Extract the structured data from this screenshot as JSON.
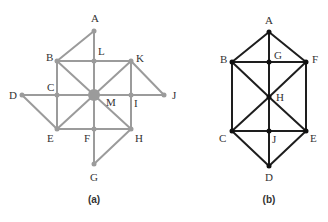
{
  "figures": [
    {
      "id": "a",
      "caption": "(a)",
      "caption_pos": [
        94,
        203
      ],
      "line_color": "#9b9b9b",
      "node_color": "#9b9b9b",
      "line_width": 2,
      "node_radius": 2.5,
      "nodes": [
        {
          "id": "A",
          "x": 94,
          "y": 31,
          "lx": 91,
          "ly": 22
        },
        {
          "id": "B",
          "x": 57,
          "y": 61,
          "lx": 46,
          "ly": 61
        },
        {
          "id": "L",
          "x": 94,
          "y": 61,
          "lx": 98,
          "ly": 55
        },
        {
          "id": "K",
          "x": 131,
          "y": 61,
          "lx": 136,
          "ly": 62
        },
        {
          "id": "D",
          "x": 22,
          "y": 95,
          "lx": 9,
          "ly": 99
        },
        {
          "id": "C",
          "x": 57,
          "y": 95,
          "lx": 47,
          "ly": 91
        },
        {
          "id": "M",
          "x": 94,
          "y": 95,
          "lx": 106,
          "ly": 106,
          "radius": 6
        },
        {
          "id": "I",
          "x": 131,
          "y": 95,
          "lx": 134,
          "ly": 107
        },
        {
          "id": "J",
          "x": 164,
          "y": 95,
          "lx": 172,
          "ly": 99
        },
        {
          "id": "E",
          "x": 57,
          "y": 129,
          "lx": 47,
          "ly": 142
        },
        {
          "id": "F",
          "x": 94,
          "y": 129,
          "lx": 84,
          "ly": 142
        },
        {
          "id": "H",
          "x": 131,
          "y": 129,
          "lx": 135,
          "ly": 142
        },
        {
          "id": "G",
          "x": 94,
          "y": 164,
          "lx": 90,
          "ly": 181
        }
      ],
      "edges": [
        [
          "A",
          "L"
        ],
        [
          "A",
          "B"
        ],
        [
          "B",
          "L"
        ],
        [
          "L",
          "K"
        ],
        [
          "L",
          "M"
        ],
        [
          "B",
          "C"
        ],
        [
          "B",
          "M"
        ],
        [
          "C",
          "D"
        ],
        [
          "C",
          "M"
        ],
        [
          "D",
          "E"
        ],
        [
          "C",
          "E"
        ],
        [
          "E",
          "M"
        ],
        [
          "E",
          "F"
        ],
        [
          "F",
          "M"
        ],
        [
          "F",
          "G"
        ],
        [
          "G",
          "H"
        ],
        [
          "F",
          "H"
        ],
        [
          "H",
          "M"
        ],
        [
          "H",
          "I"
        ],
        [
          "I",
          "M"
        ],
        [
          "I",
          "K"
        ],
        [
          "K",
          "M"
        ],
        [
          "K",
          "J"
        ],
        [
          "I",
          "J"
        ]
      ]
    },
    {
      "id": "b",
      "caption": "(b)",
      "caption_pos": [
        269,
        203
      ],
      "line_color": "#1e1e1e",
      "node_color": "#111111",
      "line_width": 2,
      "node_radius": 2.5,
      "nodes": [
        {
          "id": "A",
          "x": 269,
          "y": 32,
          "lx": 265,
          "ly": 24
        },
        {
          "id": "B",
          "x": 232,
          "y": 62,
          "lx": 220,
          "ly": 63
        },
        {
          "id": "G",
          "x": 269,
          "y": 62,
          "lx": 274,
          "ly": 59
        },
        {
          "id": "F",
          "x": 306,
          "y": 62,
          "lx": 312,
          "ly": 63
        },
        {
          "id": "H",
          "x": 269,
          "y": 97,
          "lx": 276,
          "ly": 101
        },
        {
          "id": "C",
          "x": 232,
          "y": 131,
          "lx": 219,
          "ly": 142
        },
        {
          "id": "J",
          "x": 269,
          "y": 131,
          "lx": 272,
          "ly": 143
        },
        {
          "id": "E",
          "x": 306,
          "y": 131,
          "lx": 310,
          "ly": 142
        },
        {
          "id": "D",
          "x": 269,
          "y": 166,
          "lx": 265,
          "ly": 181
        }
      ],
      "edges": [
        [
          "A",
          "B"
        ],
        [
          "A",
          "G"
        ],
        [
          "A",
          "F"
        ],
        [
          "B",
          "G"
        ],
        [
          "G",
          "F"
        ],
        [
          "G",
          "H"
        ],
        [
          "B",
          "H"
        ],
        [
          "F",
          "H"
        ],
        [
          "B",
          "C"
        ],
        [
          "F",
          "E"
        ],
        [
          "C",
          "H"
        ],
        [
          "E",
          "H"
        ],
        [
          "H",
          "J"
        ],
        [
          "C",
          "J"
        ],
        [
          "J",
          "E"
        ],
        [
          "C",
          "D"
        ],
        [
          "J",
          "D"
        ],
        [
          "E",
          "D"
        ]
      ]
    }
  ]
}
